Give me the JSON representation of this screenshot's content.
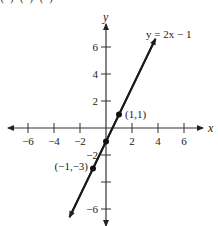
{
  "top_clipped_text": "(   ) (   )       (   )",
  "chart_data": {
    "type": "line",
    "title": "",
    "equation_label": "y = 2x − 1",
    "xlabel": "x",
    "ylabel": "y",
    "xlim": [
      -7.5,
      7.5
    ],
    "ylim": [
      -7.5,
      7.5
    ],
    "grid": false,
    "x_ticks": [
      -6,
      -4,
      -2,
      2,
      4,
      6
    ],
    "x_tick_labels": [
      "−6",
      "−4",
      "−2",
      "2",
      "4",
      "6"
    ],
    "y_ticks": [
      6,
      4,
      2,
      -2,
      -4,
      -6
    ],
    "y_tick_labels": [
      "6",
      "4",
      "2",
      "−2",
      "",
      "−6"
    ],
    "series": [
      {
        "name": "y = 2x − 1",
        "slope": 2,
        "intercept": -1,
        "x": [
          -2.8,
          3.8
        ],
        "y": [
          -6.6,
          6.6
        ]
      }
    ],
    "points": [
      {
        "x": 1,
        "y": 1,
        "label": "(1,1)"
      },
      {
        "x": 0,
        "y": -1,
        "label": ""
      },
      {
        "x": -1,
        "y": -3,
        "label": "(−1,−3)"
      }
    ],
    "colors": {
      "line": "#1a1a1a",
      "axis": "#333333"
    }
  }
}
